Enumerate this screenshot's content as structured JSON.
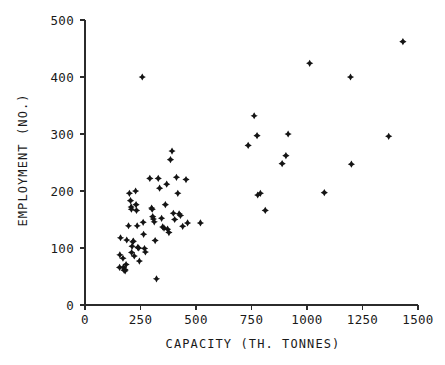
{
  "chart_data": {
    "type": "scatter",
    "title": "",
    "xlabel": "CAPACITY (TH. TONNES)",
    "ylabel": "EMPLOYMENT (NO.)",
    "xlim": [
      0,
      1500
    ],
    "ylim": [
      0,
      500
    ],
    "xticks": [
      0,
      250,
      500,
      750,
      1000,
      1250,
      1500
    ],
    "yticks": [
      0,
      100,
      200,
      300,
      400,
      500
    ],
    "xtick_labels": [
      "0",
      "250",
      "500",
      "750",
      "1000",
      "1250",
      "1500"
    ],
    "ytick_labels": [
      "0",
      "100",
      "200",
      "300",
      "400",
      "500"
    ],
    "grid": false,
    "legend": null,
    "marker": "four-pointed-star",
    "marker_color": "#141414",
    "series": [
      {
        "name": "plants",
        "points": [
          [
            160,
            118
          ],
          [
            157,
            88
          ],
          [
            156,
            66
          ],
          [
            171,
            82
          ],
          [
            173,
            66
          ],
          [
            176,
            61
          ],
          [
            180,
            62
          ],
          [
            181,
            60
          ],
          [
            185,
            71
          ],
          [
            188,
            114
          ],
          [
            196,
            139
          ],
          [
            200,
            196
          ],
          [
            205,
            183
          ],
          [
            208,
            172
          ],
          [
            209,
            168
          ],
          [
            210,
            92
          ],
          [
            212,
            103
          ],
          [
            215,
            111
          ],
          [
            218,
            112
          ],
          [
            222,
            86
          ],
          [
            228,
            200
          ],
          [
            230,
            176
          ],
          [
            232,
            166
          ],
          [
            235,
            139
          ],
          [
            238,
            101
          ],
          [
            242,
            100
          ],
          [
            245,
            77
          ],
          [
            258,
            400
          ],
          [
            262,
            145
          ],
          [
            264,
            124
          ],
          [
            268,
            99
          ],
          [
            272,
            93
          ],
          [
            292,
            222
          ],
          [
            300,
            170
          ],
          [
            303,
            168
          ],
          [
            305,
            155
          ],
          [
            308,
            151
          ],
          [
            312,
            146
          ],
          [
            316,
            113
          ],
          [
            322,
            46
          ],
          [
            330,
            222
          ],
          [
            336,
            205
          ],
          [
            345,
            152
          ],
          [
            350,
            137
          ],
          [
            356,
            135
          ],
          [
            362,
            176
          ],
          [
            368,
            212
          ],
          [
            372,
            133
          ],
          [
            378,
            127
          ],
          [
            385,
            255
          ],
          [
            392,
            270
          ],
          [
            398,
            161
          ],
          [
            404,
            150
          ],
          [
            412,
            224
          ],
          [
            418,
            196
          ],
          [
            424,
            160
          ],
          [
            430,
            157
          ],
          [
            440,
            138
          ],
          [
            455,
            220
          ],
          [
            462,
            144
          ],
          [
            520,
            144
          ],
          [
            735,
            280
          ],
          [
            762,
            332
          ],
          [
            775,
            297
          ],
          [
            778,
            193
          ],
          [
            790,
            196
          ],
          [
            812,
            166
          ],
          [
            888,
            248
          ],
          [
            905,
            262
          ],
          [
            915,
            300
          ],
          [
            1012,
            424
          ],
          [
            1078,
            197
          ],
          [
            1196,
            400
          ],
          [
            1200,
            247
          ],
          [
            1368,
            296
          ],
          [
            1432,
            462
          ]
        ]
      }
    ]
  },
  "axes": {
    "x_title": "CAPACITY (TH. TONNES)",
    "y_title": "EMPLOYMENT (NO.)"
  }
}
